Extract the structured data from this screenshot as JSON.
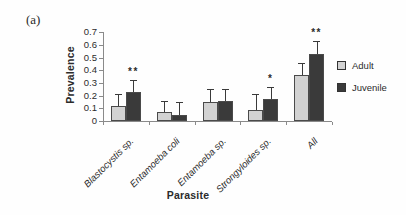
{
  "panel_label": "(a)",
  "chart_data": {
    "type": "bar",
    "title": "",
    "xlabel": "Parasite",
    "ylabel": "Prevalence",
    "ylim": [
      0,
      0.7
    ],
    "y_tick_labels": [
      "0",
      "0.1",
      "0.2",
      "0.3",
      "0.4",
      "0.5",
      "0.6",
      "0.7"
    ],
    "grid": false,
    "legend_position": "right",
    "categories": [
      "Blastocystis sp.",
      "Entamoeba coli",
      "Entamoeba sp.",
      "Strongyloides sp.",
      "All"
    ],
    "series": [
      {
        "name": "Adult",
        "color": "#d2d2d2",
        "values": [
          0.12,
          0.07,
          0.15,
          0.09,
          0.36
        ],
        "errors": [
          0.09,
          0.09,
          0.1,
          0.12,
          0.1
        ]
      },
      {
        "name": "Juvenile",
        "color": "#3a3a3a",
        "values": [
          0.23,
          0.05,
          0.16,
          0.17,
          0.53
        ],
        "errors": [
          0.09,
          0.1,
          0.09,
          0.1,
          0.1
        ]
      }
    ],
    "significance": [
      "**",
      "",
      "",
      "*",
      "**"
    ],
    "colors": {
      "bar_border": "#4a4a4a",
      "axis": "#8a8a8a",
      "error_bar": "#3a3a3a",
      "text": "#2b2b2b"
    }
  }
}
